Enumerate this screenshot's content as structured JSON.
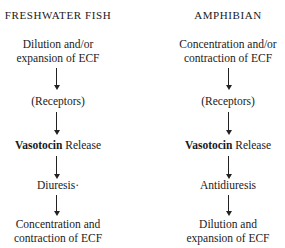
{
  "columns": [
    {
      "header": "FRESHWATER FISH",
      "steps": {
        "stimulus_line1": "Dilution and/or",
        "stimulus_line2": "expansion of ECF",
        "receptors": "(Receptors)",
        "hormone": "Vasotocin",
        "hormone_suffix": "Release",
        "effect": "Diuresis·",
        "result_line1": "Concentration and",
        "result_line2": "contraction of ECF"
      }
    },
    {
      "header": "AMPHIBIAN",
      "steps": {
        "stimulus_line1": "Concentration and/or",
        "stimulus_line2": "contraction of ECF",
        "receptors": "(Receptors)",
        "hormone": "Vasotocin",
        "hormone_suffix": "Release",
        "effect": "Antidiuresis",
        "result_line1": "Dilution and",
        "result_line2": "expansion of ECF"
      }
    }
  ]
}
